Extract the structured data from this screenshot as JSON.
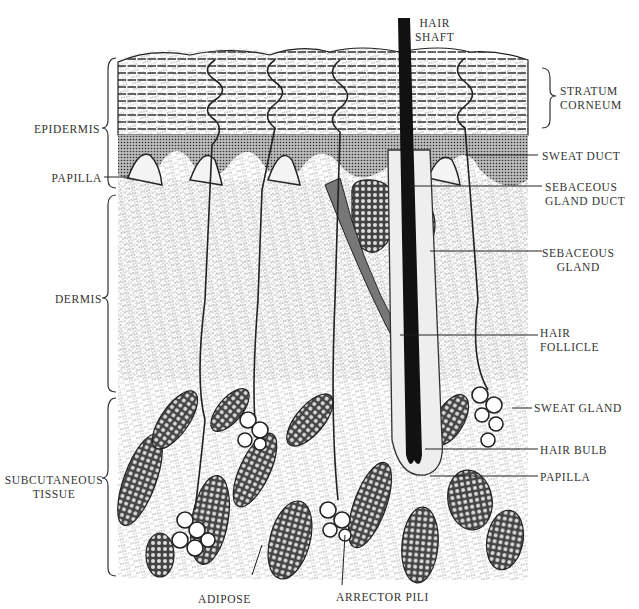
{
  "diagram": {
    "colors": {
      "ink": "#1a1a1a",
      "paper": "#ffffff",
      "label": "#333333"
    },
    "layers_left": [
      {
        "id": "epidermis",
        "label": "EPIDERMIS"
      },
      {
        "id": "papilla-left",
        "label": "PAPILLA"
      },
      {
        "id": "dermis",
        "label": "DERMIS"
      },
      {
        "id": "subcutaneous",
        "line1": "SUBCUTANEOUS",
        "line2": "TISSUE"
      }
    ],
    "labels_top": [
      {
        "id": "hair-shaft",
        "line1": "HAIR",
        "line2": "SHAFT"
      }
    ],
    "labels_right": [
      {
        "id": "stratum-corneum",
        "line1": "STRATUM",
        "line2": "CORNEUM"
      },
      {
        "id": "sweat-duct",
        "line1": "SWEAT DUCT"
      },
      {
        "id": "sebaceous-gland-duct",
        "line1": "SEBACEOUS",
        "line2": "GLAND DUCT"
      },
      {
        "id": "sebaceous-gland",
        "line1": "SEBACEOUS",
        "line2": "GLAND"
      },
      {
        "id": "hair-follicle",
        "line1": "HAIR",
        "line2": "FOLLICLE"
      },
      {
        "id": "sweat-gland",
        "line1": "SWEAT GLAND"
      },
      {
        "id": "hair-bulb",
        "line1": "HAIR BULB"
      },
      {
        "id": "papilla-right",
        "line1": "PAPILLA"
      }
    ],
    "labels_bottom": [
      {
        "id": "adipose",
        "label": "ADIPOSE"
      },
      {
        "id": "arrector-pili",
        "label": "ARRECTOR PILI"
      }
    ]
  }
}
